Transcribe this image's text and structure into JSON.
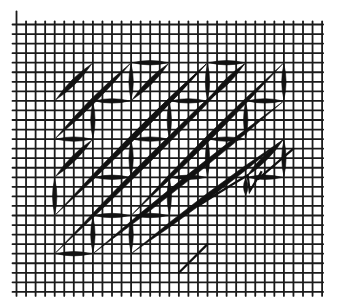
{
  "diagram": {
    "kind": "needlepoint stitch chart",
    "grid": {
      "columns": 32,
      "rows": 28
    },
    "colors": {
      "ink": "#111111",
      "grid": "#1a1a1a",
      "background": "#ffffff"
    },
    "stitch_unit": 4,
    "stitches": [
      {
        "type": "diagonal",
        "from": [
          4,
          8
        ],
        "to": [
          8,
          4
        ]
      },
      {
        "type": "diagonal",
        "from": [
          4,
          12
        ],
        "to": [
          12,
          4
        ]
      },
      {
        "type": "horizontal",
        "from": [
          12,
          4
        ],
        "to": [
          16,
          4
        ]
      },
      {
        "type": "vertical",
        "from": [
          12,
          4
        ],
        "to": [
          12,
          8
        ]
      },
      {
        "type": "horizontal",
        "from": [
          8,
          8
        ],
        "to": [
          12,
          8
        ]
      },
      {
        "type": "diagonal",
        "from": [
          12,
          8
        ],
        "to": [
          16,
          4
        ]
      },
      {
        "type": "diagonal",
        "from": [
          4,
          16
        ],
        "to": [
          8,
          12
        ]
      },
      {
        "type": "vertical",
        "from": [
          8,
          8
        ],
        "to": [
          8,
          12
        ]
      },
      {
        "type": "horizontal",
        "from": [
          4,
          12
        ],
        "to": [
          8,
          12
        ]
      },
      {
        "type": "diagonal",
        "from": [
          8,
          16
        ],
        "to": [
          20,
          4
        ]
      },
      {
        "type": "horizontal",
        "from": [
          20,
          4
        ],
        "to": [
          24,
          4
        ]
      },
      {
        "type": "vertical",
        "from": [
          20,
          4
        ],
        "to": [
          20,
          8
        ]
      },
      {
        "type": "diagonal",
        "from": [
          20,
          8
        ],
        "to": [
          24,
          4
        ]
      },
      {
        "type": "horizontal",
        "from": [
          16,
          8
        ],
        "to": [
          20,
          8
        ]
      },
      {
        "type": "vertical",
        "from": [
          16,
          8
        ],
        "to": [
          16,
          12
        ]
      },
      {
        "type": "horizontal",
        "from": [
          12,
          12
        ],
        "to": [
          16,
          12
        ]
      },
      {
        "type": "vertical",
        "from": [
          12,
          12
        ],
        "to": [
          12,
          16
        ]
      },
      {
        "type": "horizontal",
        "from": [
          8,
          16
        ],
        "to": [
          12,
          16
        ]
      },
      {
        "type": "vertical",
        "from": [
          4,
          16
        ],
        "to": [
          4,
          20
        ]
      },
      {
        "type": "diagonal",
        "from": [
          4,
          20
        ],
        "to": [
          20,
          4
        ]
      },
      {
        "type": "diagonal",
        "from": [
          4,
          24
        ],
        "to": [
          24,
          4
        ]
      },
      {
        "type": "diagonal",
        "from": [
          12,
          20
        ],
        "to": [
          28,
          4
        ]
      },
      {
        "type": "vertical",
        "from": [
          28,
          4
        ],
        "to": [
          28,
          8
        ]
      },
      {
        "type": "horizontal",
        "from": [
          24,
          8
        ],
        "to": [
          28,
          8
        ]
      },
      {
        "type": "vertical",
        "from": [
          24,
          8
        ],
        "to": [
          24,
          12
        ]
      },
      {
        "type": "horizontal",
        "from": [
          20,
          12
        ],
        "to": [
          24,
          12
        ]
      },
      {
        "type": "vertical",
        "from": [
          20,
          12
        ],
        "to": [
          20,
          16
        ]
      },
      {
        "type": "horizontal",
        "from": [
          16,
          16
        ],
        "to": [
          20,
          16
        ]
      },
      {
        "type": "vertical",
        "from": [
          16,
          16
        ],
        "to": [
          16,
          20
        ]
      },
      {
        "type": "horizontal",
        "from": [
          12,
          20
        ],
        "to": [
          16,
          20
        ]
      },
      {
        "type": "vertical",
        "from": [
          12,
          20
        ],
        "to": [
          12,
          24
        ]
      },
      {
        "type": "horizontal",
        "from": [
          8,
          20
        ],
        "to": [
          12,
          20
        ]
      },
      {
        "type": "vertical",
        "from": [
          8,
          20
        ],
        "to": [
          8,
          24
        ]
      },
      {
        "type": "horizontal",
        "from": [
          4,
          24
        ],
        "to": [
          8,
          24
        ]
      },
      {
        "type": "diagonal",
        "from": [
          8,
          24
        ],
        "to": [
          28,
          8
        ]
      },
      {
        "type": "diagonal",
        "from": [
          12,
          24
        ],
        "to": [
          28,
          12
        ]
      },
      {
        "type": "vertical",
        "from": [
          28,
          12
        ],
        "to": [
          28,
          16
        ]
      },
      {
        "type": "horizontal",
        "from": [
          24,
          16
        ],
        "to": [
          28,
          16
        ]
      },
      {
        "type": "diagonal",
        "from": [
          24,
          16
        ],
        "to": [
          28,
          12
        ]
      },
      {
        "type": "vertical",
        "from": [
          24,
          16
        ],
        "to": [
          24,
          18
        ]
      }
    ],
    "partial_stitches": [
      {
        "type": "scribble",
        "from": [
          19,
          19
        ],
        "to": [
          29,
          13
        ]
      },
      {
        "type": "short-diagonal",
        "from": [
          17,
          26
        ],
        "to": [
          20,
          23
        ]
      }
    ]
  }
}
